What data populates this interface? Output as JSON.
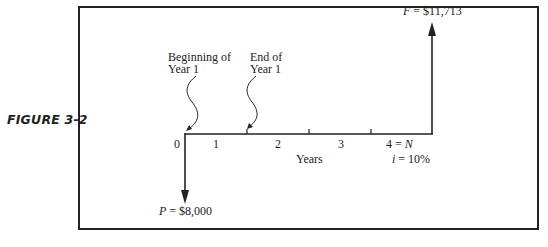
{
  "figure_label": "FIGURE 3-2",
  "annotations": {
    "beginning_line1": "Beginning of",
    "beginning_line2": "Year  1",
    "end_line1": "End of",
    "end_line2": "Year  1"
  },
  "timeline": {
    "ticks": [
      "0",
      "1",
      "2",
      "3"
    ],
    "last_tick_number": "4 = ",
    "last_tick_var": "N",
    "axis_label": "Years",
    "rate_var": "i",
    "rate_value": " = 10%"
  },
  "cash_flows": {
    "present": {
      "var": "P",
      "value": " = $8,000",
      "direction": "down",
      "period": 0
    },
    "future": {
      "var": "F",
      "value": " = $11,713",
      "direction": "up",
      "period": 4
    }
  },
  "colors": {
    "line": "#222222",
    "background": "#ffffff"
  }
}
